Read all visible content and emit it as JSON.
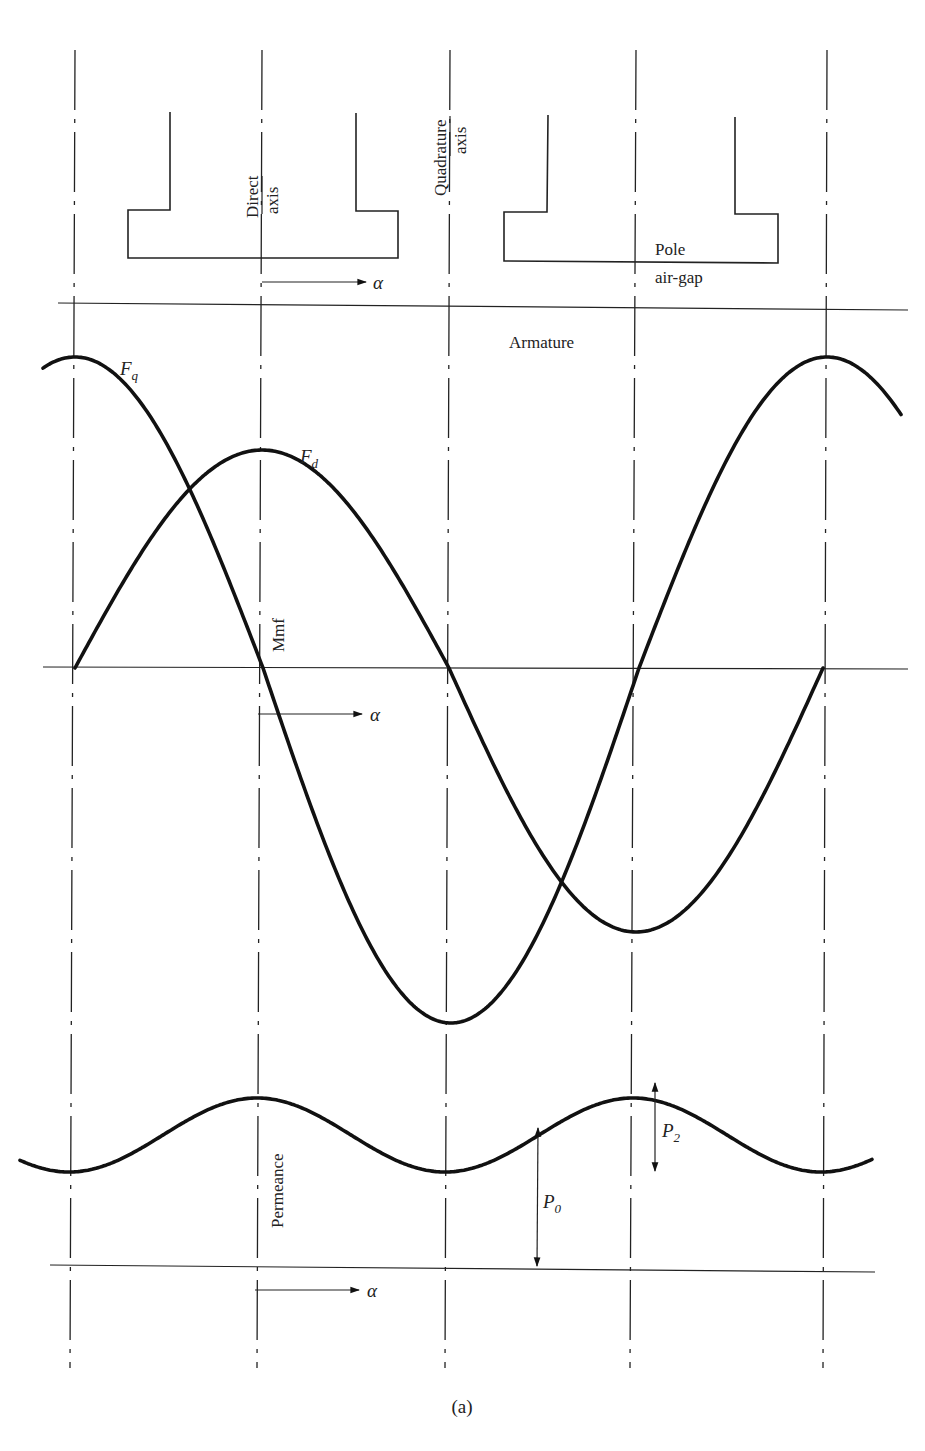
{
  "figure": {
    "caption": "(a)",
    "header_fragment": "SYNCHRONOUS MACHINES"
  },
  "labels": {
    "direct_axis_line1": "Direct",
    "direct_axis_line2": "axis",
    "quadrature_axis_line1": "Quadrature",
    "quadrature_axis_line2": "axis",
    "pole": "Pole",
    "air_gap": "air-gap",
    "armature": "Armature",
    "mmf": "Mmf",
    "permeance": "Permeance",
    "alpha": "α",
    "Fq_main": "F",
    "Fq_sub": "q",
    "Fd_main": "F",
    "Fd_sub": "d",
    "P0_main": "P",
    "P0_sub": "0",
    "P2_main": "P",
    "P2_sub": "2"
  },
  "geometry": {
    "axes_x_top": [
      75,
      262,
      450,
      636,
      827
    ],
    "axes_x_bottom": [
      70,
      257,
      445,
      630,
      823
    ],
    "axes_y_range": [
      50,
      1368
    ],
    "armature_line": {
      "x1": 58,
      "y1": 303,
      "x2": 908,
      "y2": 310
    },
    "mmf_axis": {
      "x1": 43,
      "y1": 667,
      "x2": 908,
      "y2": 669
    },
    "permeance_axis": {
      "x1": 50,
      "y1": 1265,
      "x2": 875,
      "y2": 1272
    }
  },
  "chart_data": {
    "type": "line",
    "title": "",
    "xlabel": "α",
    "panels": [
      {
        "name": "Mmf",
        "ylabel": "Mmf",
        "series": [
          {
            "name": "F_q",
            "shape": "cosine",
            "x_start": 43,
            "x_end": 902,
            "period_px": 752,
            "peak_x": 75,
            "zero_y": 668,
            "peak_y": 357,
            "trough_y": 1023
          },
          {
            "name": "F_d",
            "shape": "sine",
            "x_start": 75,
            "x_end": 823,
            "period_px": 748,
            "zero_x": 75,
            "zero_y": 668,
            "peak_y": 450,
            "trough_y": 932
          }
        ]
      },
      {
        "name": "Permeance",
        "ylabel": "Permeance",
        "series": [
          {
            "name": "Permeance",
            "shape": "P0 + P2 cos 2α",
            "x_start": 20,
            "x_end": 873,
            "period_px": 376,
            "peak_x": 257,
            "peak_y": 1098,
            "trough_y": 1172,
            "baseline_y": 1268
          }
        ],
        "annotations": [
          {
            "label": "P0",
            "from": "baseline",
            "to": "curve",
            "x": 537
          },
          {
            "label": "P2",
            "from": "peak",
            "to": "mean",
            "x": 655
          }
        ]
      }
    ]
  }
}
